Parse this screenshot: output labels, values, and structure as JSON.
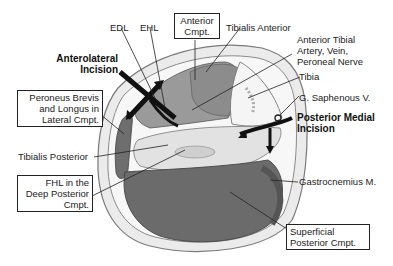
{
  "diagram": {
    "type": "anatomical cross-section",
    "labels": {
      "edl": "EDL",
      "ehl": "EHL",
      "anterior_cmpt_line1": "Anterior",
      "anterior_cmpt_line2": "Cmpt.",
      "tibialis_anterior": "Tibialis Anterior",
      "anterior_tibial_line1": "Anterior Tibial",
      "anterior_tibial_line2": "Artery, Vein,",
      "anterior_tibial_line3": "Peroneal Nerve",
      "tibia": "Tibia",
      "g_saphenous": "G. Saphenous V.",
      "posterior_medial_line1": "Posterior Medial",
      "posterior_medial_line2": "Incision",
      "anterolateral_line1": "Anterolateral",
      "anterolateral_line2": "Incision",
      "peroneus_line1": "Peroneus Brevis",
      "peroneus_line2": "and Longus in",
      "peroneus_line3": "Lateral Cmpt.",
      "tibialis_posterior": "Tibialis Posterior",
      "fhl_line1": "FHL in the",
      "fhl_line2": "Deep Posterior",
      "fhl_line3": "Cmpt.",
      "gastrocnemius": "Gastrocnemius M.",
      "superficial_line1": "Superficial",
      "superficial_line2": "Posterior Cmpt."
    },
    "colors": {
      "skin_outline": "#8a8a8a",
      "subcutaneous": "#e6e6e6",
      "muscle_dark": "#6e6e6e",
      "muscle_mid": "#9a9a9a",
      "bone": "#f4f4f4",
      "arrow": "#111111"
    }
  }
}
